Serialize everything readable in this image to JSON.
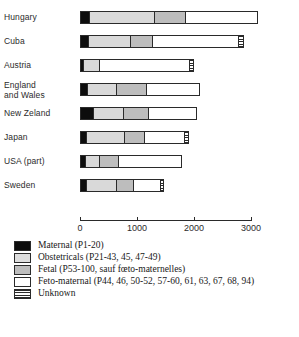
{
  "chart_data": {
    "type": "bar",
    "orientation": "horizontal",
    "stacked": true,
    "title": "",
    "xlabel": "",
    "ylabel": "",
    "xlim": [
      0,
      3000
    ],
    "grid": false,
    "legend_position": "below",
    "xticks": [
      0,
      1000,
      2000,
      3000
    ],
    "xtick_labels": [
      "0",
      "1000",
      "2000",
      "3000"
    ],
    "categories": [
      "Hungary",
      "Cuba",
      "Austria",
      "England\nand Wales",
      "New Zeland",
      "Japan",
      "USA (part)",
      "Sweden"
    ],
    "series": [
      {
        "name": "Maternal (P1-20)",
        "key": "maternal",
        "color": "#0d0d0d",
        "values": [
          160,
          150,
          55,
          120,
          230,
          115,
          90,
          110
        ]
      },
      {
        "name": "Obstetricals (P21-43, 45, 47-49)",
        "key": "obstetricals",
        "color": "#d9d9d9",
        "values": [
          1160,
          730,
          290,
          530,
          540,
          680,
          250,
          540
        ]
      },
      {
        "name": "Fetal (P53-100, sauf fœto-maternelles)",
        "key": "fetal",
        "color": "#bdbdbd",
        "values": [
          545,
          400,
          0,
          530,
          450,
          340,
          340,
          310
        ]
      },
      {
        "name": "Feto-maternal (P44, 46, 50-52, 57-60, 61, 63, 67, 68, 94)",
        "key": "fetomaternal",
        "color": "#ffffff",
        "values": [
          1265,
          1530,
          1610,
          920,
          840,
          730,
          1110,
          470
        ]
      },
      {
        "name": "Unknown",
        "key": "unknown",
        "color": "#ffffff-striped",
        "values": [
          0,
          65,
          50,
          0,
          0,
          45,
          0,
          40
        ]
      }
    ],
    "totals": [
      3130,
      2875,
      2005,
      2100,
      2060,
      1910,
      1790,
      1470
    ]
  },
  "axis": {
    "ticks": [
      {
        "value": 0,
        "label": "0"
      },
      {
        "value": 1000,
        "label": "1000"
      },
      {
        "value": 2000,
        "label": "2000"
      },
      {
        "value": 3000,
        "label": "3000"
      }
    ]
  },
  "legend": {
    "items": [
      {
        "key": "maternal",
        "label": "Maternal (P1-20)"
      },
      {
        "key": "obstetricals",
        "label": "Obstetricals (P21-43, 45, 47-49)"
      },
      {
        "key": "fetal",
        "label": "Fetal (P53-100, sauf fœto-maternelles)"
      },
      {
        "key": "fetomaternal",
        "label": "Feto-maternal  (P44, 46, 50-52, 57-60, 61, 63, 67, 68, 94)"
      },
      {
        "key": "unknown",
        "label": "Unknown"
      }
    ]
  }
}
